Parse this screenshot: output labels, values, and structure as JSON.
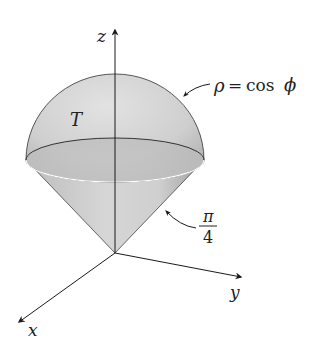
{
  "figure": {
    "region_label": "T",
    "sphere_label": {
      "lhs": "ρ",
      "eq": "=",
      "rhs": "cos",
      "var": "ϕ"
    },
    "cone_angle_label": {
      "numerator": "π",
      "denominator": "4"
    },
    "axes": {
      "x": "x",
      "y": "y",
      "z": "z"
    },
    "colors": {
      "surface_light": "#dcdcdc",
      "surface_dark": "#a9a9a9",
      "outline": "#444444",
      "axis": "#1a1a1a",
      "rim_highlight": "#ffffff"
    }
  }
}
